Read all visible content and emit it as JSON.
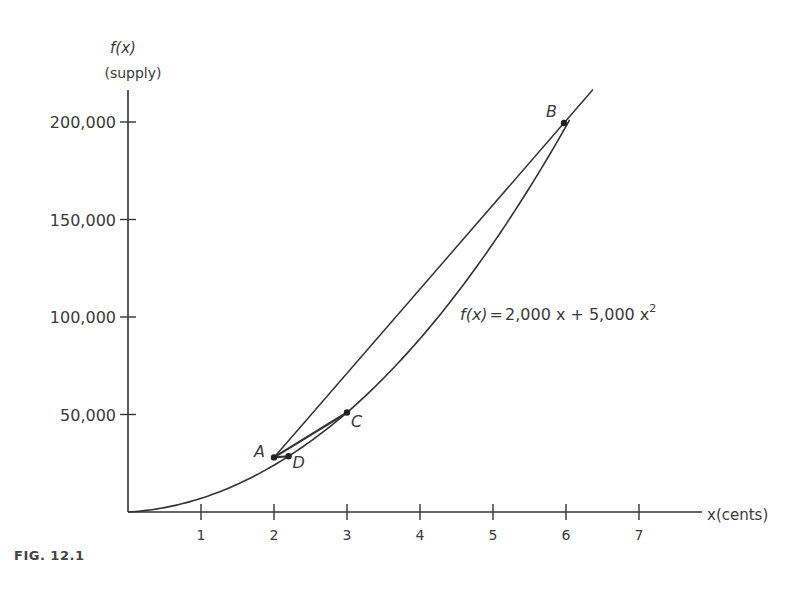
{
  "chart_data": {
    "type": "line",
    "title": "",
    "figure_label": "FIG. 12.1",
    "ylabel": "f(x)",
    "ylabel_sub": "(supply)",
    "xlabel": "x(cents)",
    "xlim": [
      0,
      8
    ],
    "ylim": [
      0,
      215000
    ],
    "x_ticks": [
      1,
      2,
      3,
      4,
      5,
      6,
      7
    ],
    "x_tick_labels": [
      "1",
      "2",
      "3",
      "4",
      "5",
      "6",
      "7"
    ],
    "y_ticks": [
      50000,
      100000,
      150000,
      200000
    ],
    "y_tick_labels": [
      "50,000",
      "100,000",
      "150,000",
      "200,000"
    ],
    "grid": false,
    "equation": "f(x) = 2,000 x + 5,000 x²",
    "equation_parts": {
      "lhs": "f(x)",
      "eq": "=",
      "rhs": "2,000 x + 5,000 x",
      "exp": "2"
    },
    "function": {
      "a": 2000,
      "b": 5000
    },
    "points": [
      {
        "label": "A",
        "x": 2,
        "y": 28000
      },
      {
        "label": "D",
        "x": 2.2,
        "y": 28600
      },
      {
        "label": "C",
        "x": 3,
        "y": 51000
      },
      {
        "label": "B",
        "x": 6,
        "y": 192000
      }
    ],
    "secants": [
      {
        "from": "A",
        "to": "B",
        "extended": true
      },
      {
        "from": "A",
        "to": "C"
      },
      {
        "from": "A",
        "to": "D"
      }
    ]
  }
}
